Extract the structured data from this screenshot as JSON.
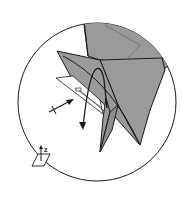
{
  "diagram": {
    "type": "origami-step-detail",
    "colors": {
      "paper_fill": "#9a9a9a",
      "paper_light": "#ffffff",
      "line": "#1a1a1a",
      "crease": "#6a6a6a",
      "background": "#ffffff"
    },
    "axis_indicator": {
      "label": "z"
    },
    "symbols": [
      {
        "name": "fold-arrow",
        "meaning": "fold flap down"
      },
      {
        "name": "push-arrow",
        "meaning": "push / crossed arrow"
      }
    ]
  }
}
